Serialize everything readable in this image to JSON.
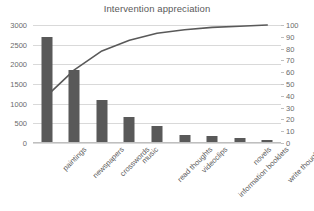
{
  "chart_data": {
    "type": "bar",
    "title": "Intervention appreciation",
    "xlabel": "",
    "ylabel": "",
    "categories": [
      "paintings",
      "newspapers",
      "crosswords",
      "music",
      "read thoughts",
      "videoclips",
      "information booklets",
      "novels",
      "write thoughts"
    ],
    "series": [
      {
        "name": "count",
        "type": "bar",
        "axis": "left",
        "values": [
          2700,
          1850,
          1090,
          660,
          430,
          200,
          180,
          120,
          70
        ]
      },
      {
        "name": "cumulative percentage",
        "type": "line",
        "axis": "right",
        "values": [
          40,
          62,
          78,
          87,
          93,
          96,
          98,
          99,
          100
        ]
      }
    ],
    "ylim": [
      0,
      3000
    ],
    "y2lim": [
      0,
      100
    ],
    "yticks": [
      0,
      500,
      1000,
      1500,
      2000,
      2500,
      3000
    ],
    "y2ticks": [
      0,
      10,
      20,
      30,
      40,
      50,
      60,
      70,
      80,
      90,
      100
    ],
    "grid": true,
    "legend": "none",
    "colors": {
      "bar": "#595959",
      "line": "#595959",
      "grid": "#d9d9d9",
      "axis": "#bfbfbf",
      "text": "#5a5a5a",
      "background": "#ffffff"
    }
  }
}
